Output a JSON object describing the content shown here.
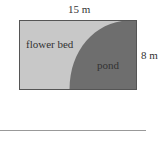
{
  "diagram": {
    "width_label": "15 m",
    "height_label": "8 m",
    "region_left_label": "flower bed",
    "region_right_label": "pond",
    "colors": {
      "flower_bed": "#c8c8c8",
      "pond": "#6e6e6e",
      "outline": "#555555",
      "rule_line": "#999999"
    }
  }
}
